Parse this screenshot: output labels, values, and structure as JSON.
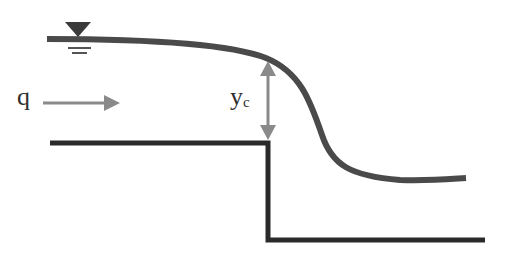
{
  "diagram": {
    "labels": {
      "discharge": "q",
      "critical_depth_main": "y",
      "critical_depth_sub": "c"
    },
    "symbols": {
      "water_surface": "inverted-triangle-water-surface-symbol",
      "flow_arrow": "right-arrow",
      "depth_arrow": "double-headed-vertical-arrow"
    },
    "colors": {
      "water_surface": "#4a4a4a",
      "channel_bed": "#2a2a2a",
      "arrow": "#8a8a8a",
      "text": "#2f2f2f",
      "background": "#ffffff"
    }
  }
}
